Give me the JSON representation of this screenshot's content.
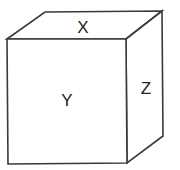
{
  "diagram": {
    "type": "cube",
    "faces": {
      "top": {
        "label": "X"
      },
      "front": {
        "label": "Y"
      },
      "side": {
        "label": "Z"
      }
    },
    "colors": {
      "stroke": "#3a3a3a",
      "fill": "#ffffff",
      "text": "#222222"
    }
  }
}
